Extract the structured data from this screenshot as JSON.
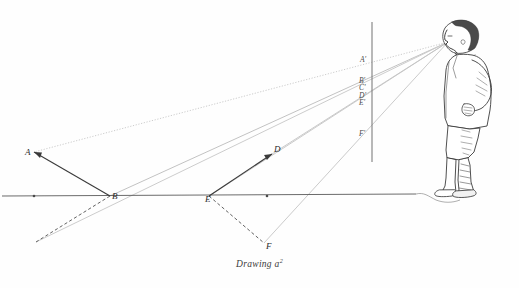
{
  "figure": {
    "caption": "Drawing a",
    "caption_superscript": "2",
    "title": "Drawing a2",
    "colors": {
      "ink": "#2b2b2b",
      "ground_line": "#555555",
      "sight_ray": "#b9b9b9",
      "picture_plane": "#8a8a8a",
      "dashed": "#6e6e6e",
      "paper": "#fefefe"
    },
    "ground_points": [
      {
        "id": "A",
        "label": "A",
        "x": 34,
        "y": 152,
        "label_x": 25,
        "label_y": 155
      },
      {
        "id": "B",
        "label": "B",
        "x": 110,
        "y": 196,
        "label_x": 112,
        "label_y": 199
      },
      {
        "id": "C",
        "label": "C",
        "x": 34,
        "y": 196,
        "label_x": 30,
        "label_y": 210
      },
      {
        "id": "D",
        "label": "D",
        "x": 272,
        "y": 154,
        "label_x": 274,
        "label_y": 152
      },
      {
        "id": "E",
        "label": "E",
        "x": 209,
        "y": 196,
        "label_x": 205,
        "label_y": 202
      },
      {
        "id": "F",
        "label": "F",
        "x": 264,
        "y": 243,
        "label_x": 266,
        "label_y": 249
      }
    ],
    "plane_points": [
      {
        "id": "Aprime",
        "label": "A'",
        "x": 372,
        "y": 60,
        "label_x": 360,
        "label_y": 62
      },
      {
        "id": "Bprime",
        "label": "B'",
        "x": 372,
        "y": 81,
        "label_x": 359,
        "label_y": 83
      },
      {
        "id": "Cprime",
        "label": "C'",
        "x": 372,
        "y": 88,
        "label_x": 359,
        "label_y": 90
      },
      {
        "id": "Dprime",
        "label": "D'",
        "x": 372,
        "y": 96,
        "label_x": 359,
        "label_y": 98
      },
      {
        "id": "Eprime",
        "label": "E'",
        "x": 372,
        "y": 103,
        "label_x": 359,
        "label_y": 105
      },
      {
        "id": "Fprime",
        "label": "F'",
        "x": 372,
        "y": 133,
        "label_x": 359,
        "label_y": 136
      }
    ],
    "viewpoint": {
      "id": "eye",
      "label": "",
      "x": 448,
      "y": 42
    },
    "picture_plane": {
      "x": 372,
      "y_top": 22,
      "y_bottom": 162
    },
    "ground_line": {
      "x_start": 2,
      "y_start": 196,
      "x_end": 416,
      "y_end": 194
    },
    "ground_dots": [
      {
        "x": 34,
        "y": 196
      },
      {
        "x": 267,
        "y": 196
      }
    ],
    "figure_person": {
      "name": "boy-in-profile",
      "facing": "left",
      "x": 424,
      "y": 14,
      "width": 78,
      "height": 182
    }
  }
}
